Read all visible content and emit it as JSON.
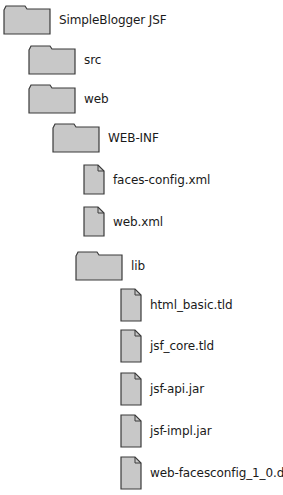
{
  "diagram": {
    "type": "file-tree",
    "colors": {
      "icon_fill": "#c8c8c8",
      "icon_stroke": "#3a3a3a",
      "text": "#1a1a1a"
    },
    "nodes": [
      {
        "id": "root",
        "label": "SimpleBlogger JSF",
        "kind": "folder",
        "depth": 0
      },
      {
        "id": "src",
        "label": "src",
        "kind": "folder",
        "depth": 1
      },
      {
        "id": "web",
        "label": "web",
        "kind": "folder",
        "depth": 1
      },
      {
        "id": "webinf",
        "label": "WEB-INF",
        "kind": "folder",
        "depth": 2
      },
      {
        "id": "facesconfig",
        "label": "faces-config.xml",
        "kind": "file",
        "depth": 3
      },
      {
        "id": "webxml",
        "label": "web.xml",
        "kind": "file",
        "depth": 3
      },
      {
        "id": "lib",
        "label": "lib",
        "kind": "folder",
        "depth": 3
      },
      {
        "id": "htmlbasic",
        "label": "html_basic.tld",
        "kind": "file",
        "depth": 4
      },
      {
        "id": "jsfcore",
        "label": "jsf_core.tld",
        "kind": "file",
        "depth": 4
      },
      {
        "id": "jsfapi",
        "label": "jsf-api.jar",
        "kind": "file",
        "depth": 4
      },
      {
        "id": "jsfimpl",
        "label": "jsf-impl.jar",
        "kind": "file",
        "depth": 4
      },
      {
        "id": "webfacesdtd",
        "label": "web-facesconfig_1_0.dtd",
        "kind": "file",
        "depth": 4
      }
    ]
  }
}
